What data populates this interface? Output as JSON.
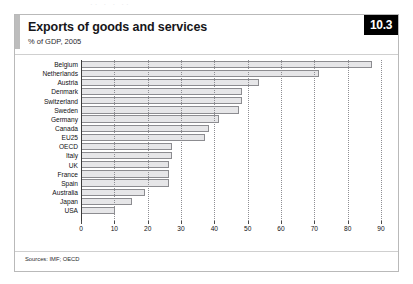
{
  "page": {
    "bleed_text": "··      ·  ·    ··"
  },
  "figure": {
    "badge": "10.3",
    "title": "Exports of goods and services",
    "subtitle": "% of GDP, 2005",
    "source": "Sources: IMF; OECD",
    "colors": {
      "bar_fill": "#e6e6e8",
      "bar_stroke": "#8c8c90",
      "badge_bg": "#000000",
      "badge_text": "#ffffff",
      "accent": "#bdbdbd",
      "frame": "#b9b9b9",
      "grid": "#8e8e93"
    }
  },
  "chart_data": {
    "type": "bar",
    "orientation": "horizontal",
    "title": "Exports of goods and services",
    "subtitle": "% of GDP, 2005",
    "xlabel": "",
    "ylabel": "",
    "xlim": [
      0,
      90
    ],
    "grid": true,
    "legend": "none",
    "xticks": [
      0,
      10,
      20,
      30,
      40,
      50,
      60,
      70,
      80,
      90
    ],
    "xtick_labels": [
      "0",
      "10",
      "20",
      "30",
      "40",
      "50",
      "60",
      "70",
      "80",
      "90"
    ],
    "categories": [
      "Belgium",
      "Netherlands",
      "Austria",
      "Denmark",
      "Switzerland",
      "Sweden",
      "Germany",
      "Canada",
      "EU25",
      "OECD",
      "Italy",
      "UK",
      "France",
      "Spain",
      "Australia",
      "Japan",
      "USA"
    ],
    "values": [
      87,
      71,
      53,
      48,
      48,
      47,
      41,
      38,
      37,
      27,
      27,
      26,
      26,
      26,
      19,
      15,
      10
    ]
  }
}
